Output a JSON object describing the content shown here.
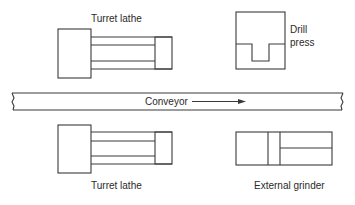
{
  "diagram": {
    "type": "layout",
    "machines": [
      {
        "id": "turret-lathe-top",
        "label": "Turret lathe"
      },
      {
        "id": "drill-press",
        "label_line1": "Drill",
        "label_line2": "press"
      },
      {
        "id": "turret-lathe-bottom",
        "label": "Turret lathe"
      },
      {
        "id": "external-grinder",
        "label": "External grinder"
      }
    ],
    "conveyor": {
      "label": "Conveyor",
      "direction": "right"
    },
    "colors": {
      "line": "#3a3a3a",
      "text": "#2a2a2a",
      "background": "#ffffff"
    }
  }
}
